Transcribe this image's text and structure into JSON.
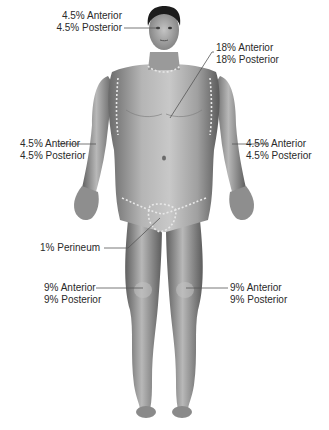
{
  "diagram": {
    "type": "rule-of-nines-body-surface-area",
    "view": "anterior",
    "colors": {
      "background": "#ffffff",
      "skin_light": "#c9c9c9",
      "skin_mid": "#9a9a9a",
      "skin_dark": "#5e5e5e",
      "hair": "#1c1c1c",
      "text": "#2a2a2a",
      "leader": "#555555",
      "boundary_dash": "#e8e8e8"
    },
    "labels": [
      {
        "id": "head",
        "region": "Head and neck",
        "anterior": "4.5% Anterior",
        "posterior": "4.5% Posterior"
      },
      {
        "id": "trunk",
        "region": "Trunk",
        "anterior": "18% Anterior",
        "posterior": "18% Posterior"
      },
      {
        "id": "right-arm",
        "region": "Right arm",
        "anterior": "4.5% Anterior",
        "posterior": "4.5% Posterior"
      },
      {
        "id": "left-arm",
        "region": "Left arm",
        "anterior": "4.5% Anterior",
        "posterior": "4.5% Posterior"
      },
      {
        "id": "perineum",
        "region": "Perineum",
        "text": "1% Perineum"
      },
      {
        "id": "right-leg",
        "region": "Right leg",
        "anterior": "9% Anterior",
        "posterior": "9% Posterior"
      },
      {
        "id": "left-leg",
        "region": "Left leg",
        "anterior": "9% Anterior",
        "posterior": "9% Posterior"
      }
    ]
  }
}
